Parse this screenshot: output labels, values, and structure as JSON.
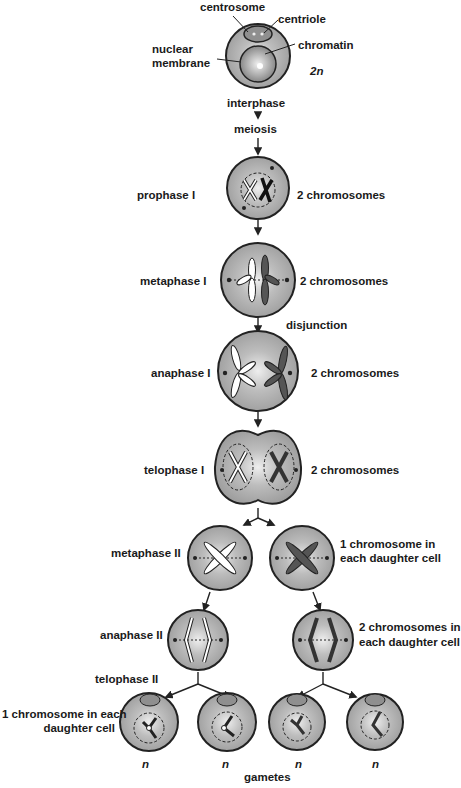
{
  "title": "Meiosis",
  "interphase_cell": {
    "labels": {
      "centrosome": "centrosome",
      "centriole": "centriole",
      "nuclear_membrane_1": "nuclear",
      "nuclear_membrane_2": "membrane",
      "chromatin": "chromatin",
      "ploidy": "2n"
    }
  },
  "flow": {
    "interphase": "interphase",
    "meiosis": "meiosis",
    "disjunction": "disjunction"
  },
  "stages": {
    "prophase_1": {
      "name": "prophase I",
      "note": "2 chromosomes"
    },
    "metaphase_1": {
      "name": "metaphase I",
      "note": "2 chromosomes"
    },
    "anaphase_1": {
      "name": "anaphase I",
      "note": "2 chromosomes"
    },
    "telophase_1": {
      "name": "telophase I",
      "note": "2 chromosomes"
    },
    "metaphase_2": {
      "name": "metaphase II",
      "note_line1": "1 chromosome in",
      "note_line2": "each daughter cell"
    },
    "anaphase_2": {
      "name": "anaphase II",
      "note_line1": "2 chromosomes in",
      "note_line2": "each daughter cell"
    },
    "telophase_2": {
      "name": "telophase II",
      "note_line1": "1 chromosome in each",
      "note_line2": "daughter cell"
    }
  },
  "gametes": {
    "label": "gametes",
    "ploidy": [
      "n",
      "n",
      "n",
      "n"
    ]
  },
  "colors": {
    "cell_fill": "#a9a9a9",
    "cell_highlight": "#e6e6e6",
    "outline": "#222222",
    "text": "#1a1a1a"
  }
}
